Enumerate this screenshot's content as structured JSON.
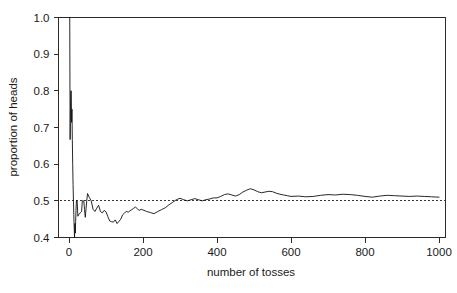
{
  "chart_data": {
    "type": "line",
    "title": "",
    "subtitle": "",
    "xlabel": "number of tosses",
    "ylabel": "proportion of heads",
    "xlim": [
      0,
      1000
    ],
    "ylim": [
      0.4,
      1.0
    ],
    "xticks": [
      0,
      200,
      400,
      600,
      800,
      1000
    ],
    "xtick_labels": [
      "0",
      "200",
      "400",
      "600",
      "800",
      "1000"
    ],
    "yticks": [
      0.4,
      0.5,
      0.6,
      0.7,
      0.8,
      0.9,
      1.0
    ],
    "ytick_labels": [
      "0.4",
      "0.5",
      "0.6",
      "0.7",
      "0.8",
      "0.9",
      "1.0"
    ],
    "grid": false,
    "legend": null,
    "annotations": [],
    "reference_lines": [
      {
        "name": "fair-coin-probability",
        "orientation": "horizontal",
        "y": 0.5,
        "style": "dashed",
        "color": "#222222"
      }
    ],
    "series": [
      {
        "name": "running proportion of heads",
        "color": "#111111",
        "style": "solid",
        "x": [
          1,
          2,
          3,
          4,
          5,
          6,
          7,
          8,
          9,
          10,
          11,
          12,
          13,
          14,
          15,
          16,
          17,
          18,
          19,
          20,
          22,
          24,
          26,
          28,
          30,
          32,
          34,
          36,
          38,
          40,
          42,
          44,
          46,
          48,
          50,
          55,
          60,
          65,
          70,
          75,
          80,
          85,
          90,
          95,
          100,
          105,
          110,
          115,
          120,
          125,
          130,
          135,
          140,
          145,
          150,
          155,
          160,
          165,
          170,
          175,
          180,
          185,
          190,
          195,
          200,
          210,
          220,
          230,
          240,
          250,
          260,
          270,
          280,
          290,
          300,
          310,
          320,
          330,
          340,
          350,
          360,
          370,
          380,
          390,
          400,
          410,
          420,
          430,
          440,
          450,
          460,
          470,
          480,
          490,
          500,
          510,
          520,
          530,
          540,
          550,
          560,
          570,
          580,
          590,
          600,
          620,
          640,
          660,
          680,
          700,
          720,
          740,
          760,
          780,
          800,
          820,
          840,
          860,
          880,
          900,
          920,
          940,
          960,
          980,
          1000
        ],
        "y": [
          1.0,
          1.0,
          0.667,
          0.75,
          0.8,
          0.8,
          0.714,
          0.75,
          0.667,
          0.6,
          0.545,
          0.5,
          0.462,
          0.429,
          0.4,
          0.438,
          0.412,
          0.444,
          0.474,
          0.5,
          0.5,
          0.458,
          0.462,
          0.464,
          0.467,
          0.469,
          0.471,
          0.5,
          0.5,
          0.5,
          0.476,
          0.455,
          0.478,
          0.5,
          0.52,
          0.509,
          0.5,
          0.477,
          0.471,
          0.48,
          0.488,
          0.471,
          0.467,
          0.474,
          0.47,
          0.457,
          0.445,
          0.443,
          0.442,
          0.448,
          0.438,
          0.444,
          0.45,
          0.462,
          0.467,
          0.471,
          0.469,
          0.473,
          0.476,
          0.48,
          0.483,
          0.478,
          0.474,
          0.477,
          0.475,
          0.471,
          0.468,
          0.465,
          0.471,
          0.476,
          0.481,
          0.489,
          0.496,
          0.503,
          0.507,
          0.503,
          0.5,
          0.503,
          0.506,
          0.503,
          0.5,
          0.503,
          0.505,
          0.508,
          0.508,
          0.512,
          0.517,
          0.519,
          0.516,
          0.513,
          0.517,
          0.524,
          0.529,
          0.533,
          0.53,
          0.525,
          0.522,
          0.524,
          0.526,
          0.525,
          0.521,
          0.518,
          0.516,
          0.514,
          0.512,
          0.513,
          0.511,
          0.512,
          0.515,
          0.517,
          0.516,
          0.518,
          0.517,
          0.515,
          0.512,
          0.51,
          0.513,
          0.515,
          0.514,
          0.513,
          0.512,
          0.513,
          0.512,
          0.511,
          0.51
        ]
      }
    ]
  },
  "axes": {
    "x_title": "number of tosses",
    "y_title": "proportion of heads"
  }
}
